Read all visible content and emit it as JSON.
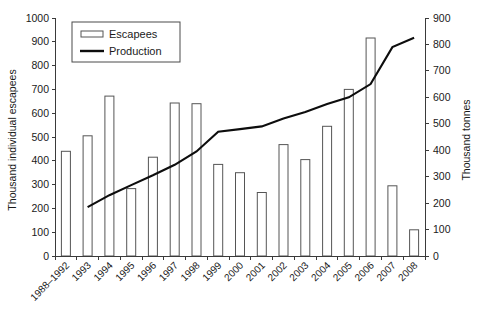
{
  "chart_data": {
    "type": "bar",
    "title": "",
    "subtitle": "",
    "xlabel": "",
    "ylabel": "Thousand individual escapees",
    "y2label": "Thousand tonnes",
    "grid": false,
    "legend_position": "top-left-inside",
    "categories": [
      "1988–1992",
      "1993",
      "1994",
      "1995",
      "1996",
      "1997",
      "1998",
      "1999",
      "2000",
      "2001",
      "2002",
      "2003",
      "2004",
      "2005",
      "2006",
      "2007",
      "2008"
    ],
    "ylim": [
      0,
      1000
    ],
    "y2lim": [
      0,
      900
    ],
    "yticks": [
      0,
      100,
      200,
      300,
      400,
      500,
      600,
      700,
      800,
      900,
      1000
    ],
    "y2ticks": [
      0,
      100,
      200,
      300,
      400,
      500,
      600,
      700,
      800,
      900
    ],
    "ytick_labels": [
      "0",
      "100",
      "200",
      "300",
      "400",
      "500",
      "600",
      "700",
      "800",
      "900",
      "1000"
    ],
    "y2tick_labels": [
      "0",
      "100",
      "200",
      "300",
      "400",
      "500",
      "600",
      "700",
      "800",
      "900"
    ],
    "series": [
      {
        "name": "Escapees",
        "type": "bar",
        "axis": "left",
        "unit": "Thousand individual escapees",
        "values": [
          440,
          505,
          672,
          283,
          415,
          643,
          640,
          385,
          350,
          267,
          468,
          405,
          545,
          700,
          916,
          295,
          110
        ]
      },
      {
        "name": "Production",
        "type": "line",
        "axis": "right",
        "unit": "Thousand tonnes",
        "values": [
          null,
          185,
          230,
          268,
          305,
          345,
          395,
          470,
          480,
          490,
          520,
          545,
          575,
          600,
          650,
          790,
          825
        ]
      }
    ]
  },
  "legend": {
    "entries": [
      {
        "label": "Escapees",
        "marker": "bar-swatch"
      },
      {
        "label": "Production",
        "marker": "line-swatch"
      }
    ]
  },
  "axes": {
    "left_title": "Thousand individual escapees",
    "right_title": "Thousand tonnes"
  }
}
